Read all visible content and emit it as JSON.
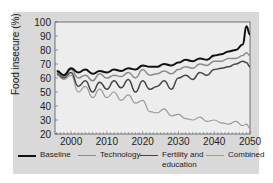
{
  "chart_data": {
    "type": "line",
    "title": "",
    "xlabel": "",
    "ylabel": "Food insecure (%)",
    "xlim": [
      1995.5,
      2050
    ],
    "ylim": [
      20,
      100
    ],
    "xticks": [
      2000,
      2010,
      2020,
      2030,
      2040,
      2050
    ],
    "yticks": [
      20,
      30,
      40,
      50,
      60,
      70,
      80,
      90,
      100
    ],
    "grid": false,
    "legend_position": "bottom",
    "x": [
      1996,
      1998,
      2000,
      2002,
      2004,
      2006,
      2008,
      2010,
      2012,
      2014,
      2016,
      2018,
      2020,
      2022,
      2024,
      2026,
      2028,
      2030,
      2032,
      2034,
      2036,
      2038,
      2040,
      2042,
      2044,
      2046,
      2048,
      2049,
      2050
    ],
    "series": [
      {
        "name": "Baseline",
        "color": "#111111",
        "values": [
          65,
          62,
          67,
          64,
          66,
          63,
          65,
          64,
          66,
          65,
          67,
          66,
          69,
          68,
          68,
          70,
          69,
          71,
          73,
          72,
          74,
          73,
          76,
          77,
          79,
          80,
          84,
          97,
          91
        ]
      },
      {
        "name": "Technology",
        "color": "#8a8a8a",
        "values": [
          64,
          61,
          66,
          60,
          62,
          58,
          63,
          60,
          62,
          61,
          64,
          60,
          66,
          62,
          63,
          65,
          63,
          66,
          68,
          67,
          70,
          69,
          72,
          72,
          74,
          74,
          76,
          78,
          76
        ]
      },
      {
        "name": "Fertility and education",
        "color": "#444444",
        "values": [
          63,
          60,
          64,
          54,
          58,
          50,
          57,
          52,
          58,
          53,
          59,
          50,
          58,
          52,
          54,
          58,
          52,
          60,
          62,
          59,
          64,
          62,
          66,
          67,
          68,
          70,
          72,
          71,
          68
        ]
      },
      {
        "name": "Combined",
        "color": "#9a9a9a",
        "values": [
          62,
          59,
          62,
          50,
          54,
          46,
          52,
          46,
          50,
          44,
          48,
          42,
          44,
          36,
          35,
          38,
          33,
          34,
          31,
          30,
          32,
          29,
          30,
          28,
          27,
          29,
          26,
          27,
          24
        ]
      }
    ]
  },
  "axis": {
    "y_ticks": [
      "100",
      "90",
      "80",
      "70",
      "60",
      "50",
      "40",
      "30",
      "20"
    ],
    "x_ticks": [
      "2000",
      "2010",
      "2020",
      "2030",
      "2040",
      "2050"
    ],
    "y_title": "Food insecure (%)"
  },
  "legend": {
    "items": [
      {
        "label": "Baseline",
        "color": "#111111"
      },
      {
        "label": "Technology",
        "color": "#8a8a8a"
      },
      {
        "label": "Fertility and",
        "label2": "education",
        "color": "#444444"
      },
      {
        "label": "Combined",
        "color": "#9a9a9a"
      }
    ]
  }
}
